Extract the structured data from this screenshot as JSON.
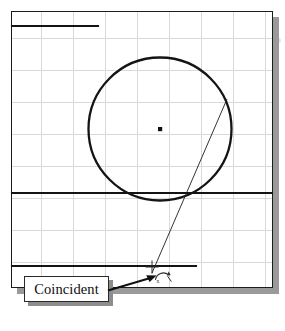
{
  "figure": {
    "kind": "cad-sketch-screenshot",
    "background_color": "#ffffff"
  },
  "panel": {
    "name": "drawing-area",
    "border_color": "#1c1c1c",
    "shadow_color": "#9a9a9a",
    "grid": {
      "visible": true,
      "color": "#d9d9dd",
      "spacing_px": 32
    }
  },
  "sketch": {
    "entities": [
      {
        "type": "line",
        "name": "top-horizontal-line",
        "x1": 12,
        "y1": 26,
        "x2": 98,
        "y2": 26,
        "weight": 2.1,
        "color": "#141414"
      },
      {
        "type": "line",
        "name": "middle-horizontal-line",
        "x1": 12,
        "y1": 193,
        "x2": 272,
        "y2": 193,
        "weight": 2.1,
        "color": "#141414"
      },
      {
        "type": "line",
        "name": "bottom-horizontal-line",
        "x1": 12,
        "y1": 266,
        "x2": 196,
        "y2": 266,
        "weight": 2.1,
        "color": "#141414"
      },
      {
        "type": "circle",
        "name": "sketch-circle",
        "cx": 160,
        "cy": 129,
        "r": 71.5,
        "weight": 2.2,
        "color": "#141414"
      },
      {
        "type": "point",
        "name": "circle-center-point",
        "cx": 160,
        "cy": 129,
        "size": 4,
        "color": "#111111"
      },
      {
        "type": "line",
        "name": "angled-construction-line",
        "x1": 227,
        "y1": 99,
        "x2": 152,
        "y2": 273,
        "weight": 0.9,
        "color": "#1d1d1d"
      }
    ]
  },
  "cursor": {
    "name": "coincident-cursor",
    "crosshair": {
      "cx": 152,
      "cy": 267,
      "arm": 6
    },
    "glyph": {
      "cx": 163,
      "cy": 276,
      "label": "coincident-symbol"
    },
    "color": "#262626"
  },
  "callout": {
    "label": "Coincident",
    "box": {
      "x": 24,
      "y": 276,
      "w": 85,
      "h": 26
    },
    "border_color": "#2a2a2a",
    "fill_color": "#ffffff",
    "shadow_color": "#8d8d8d",
    "arrow": {
      "name": "callout-leader-arrow",
      "from_x": 108,
      "from_y": 290,
      "to_x": 156,
      "to_y": 276,
      "color": "#101010"
    }
  }
}
